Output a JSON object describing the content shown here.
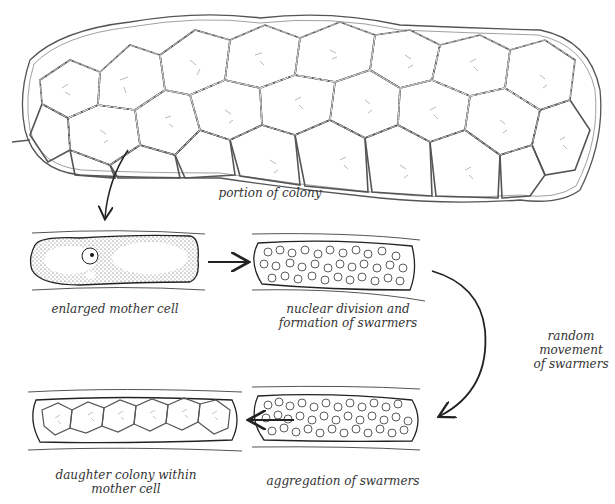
{
  "diagram": {
    "labels": {
      "colony": "portion of colony",
      "mother_cell": "enlarged mother cell",
      "nuclear_division_line1": "nuclear division and",
      "nuclear_division_line2": "formation of swarmers",
      "random_line1": "random",
      "random_line2": "movement",
      "random_line3": "of swarmers",
      "aggregation": "aggregation of swarmers",
      "daughter_line1": "daughter colony within",
      "daughter_line2": "mother cell"
    },
    "stages": [
      {
        "id": "colony",
        "label": "portion of colony"
      },
      {
        "id": "mother-cell",
        "label": "enlarged mother cell"
      },
      {
        "id": "swarmers-formed",
        "label": "nuclear division and formation of swarmers"
      },
      {
        "id": "random-movement",
        "label": "random movement of swarmers"
      },
      {
        "id": "aggregation",
        "label": "aggregation of swarmers"
      },
      {
        "id": "daughter-colony",
        "label": "daughter colony within mother cell"
      }
    ],
    "flow": [
      "colony -> mother-cell",
      "mother-cell -> swarmers-formed",
      "swarmers-formed -> aggregation (random movement)",
      "aggregation -> daughter-colony"
    ],
    "colors": {
      "ink": "#222222",
      "background": "#ffffff"
    }
  }
}
